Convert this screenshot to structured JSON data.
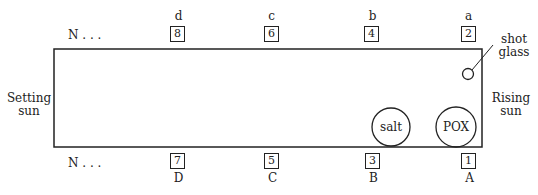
{
  "diagram": {
    "north_marker_top": "N . . .",
    "north_marker_bottom": "N . . .",
    "top_positions": [
      {
        "letter": "d",
        "number": "8"
      },
      {
        "letter": "c",
        "number": "6"
      },
      {
        "letter": "b",
        "number": "4"
      },
      {
        "letter": "a",
        "number": "2"
      }
    ],
    "bottom_positions": [
      {
        "letter": "D",
        "number": "7"
      },
      {
        "letter": "C",
        "number": "5"
      },
      {
        "letter": "B",
        "number": "3"
      },
      {
        "letter": "A",
        "number": "1"
      }
    ],
    "left_label": [
      "Setting",
      "sun"
    ],
    "right_label": [
      "Rising",
      "sun"
    ],
    "objects": {
      "salt": "salt",
      "pox": "POX",
      "shot_glass": [
        "shot",
        "glass"
      ]
    }
  }
}
